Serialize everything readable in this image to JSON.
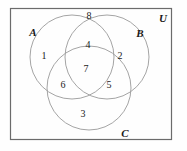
{
  "figure": {
    "type": "venn-diagram-3-set",
    "background_color": "#fefefe",
    "stroke_color": "#9a9a9a",
    "frame_color": "#6b6b6b",
    "text_color": "#1a1a1a"
  },
  "universe": {
    "label": "U",
    "frame": {
      "x": 10,
      "y": 8,
      "width": 162,
      "height": 132
    },
    "label_position": {
      "x": 163,
      "y": 18
    }
  },
  "sets": [
    {
      "id": "A",
      "label": "A",
      "circle": {
        "cx": 72,
        "cy": 57,
        "r": 42
      },
      "label_position": {
        "x": 33,
        "y": 32
      }
    },
    {
      "id": "B",
      "label": "B",
      "circle": {
        "cx": 107,
        "cy": 57,
        "r": 42
      },
      "label_position": {
        "x": 140,
        "y": 33
      }
    },
    {
      "id": "C",
      "label": "C",
      "circle": {
        "cx": 89,
        "cy": 88,
        "r": 42
      },
      "label_position": {
        "x": 125,
        "y": 133
      }
    }
  ],
  "regions": [
    {
      "id": "region-a-only",
      "label": "1",
      "membership": "A only",
      "position": {
        "x": 44,
        "y": 56
      }
    },
    {
      "id": "region-b-only",
      "label": "2",
      "membership": "B only",
      "position": {
        "x": 120,
        "y": 56
      }
    },
    {
      "id": "region-c-only",
      "label": "3",
      "membership": "C only",
      "position": {
        "x": 83,
        "y": 114
      }
    },
    {
      "id": "region-a-and-b",
      "label": "4",
      "membership": "A and B",
      "position": {
        "x": 88,
        "y": 45
      }
    },
    {
      "id": "region-b-and-c",
      "label": "5",
      "membership": "B and C",
      "position": {
        "x": 109,
        "y": 85
      }
    },
    {
      "id": "region-a-and-c",
      "label": "6",
      "membership": "A and C",
      "position": {
        "x": 63,
        "y": 85
      }
    },
    {
      "id": "region-a-b-and-c",
      "label": "7",
      "membership": "A and B and C",
      "position": {
        "x": 86,
        "y": 69
      }
    },
    {
      "id": "region-outside",
      "label": "8",
      "membership": "outside all sets",
      "position": {
        "x": 89,
        "y": 16
      }
    }
  ],
  "chart_data": {
    "type": "diagram",
    "title": "",
    "sets": [
      "A",
      "B",
      "C"
    ],
    "universe": "U",
    "region_labels": {
      "A_only": "1",
      "B_only": "2",
      "C_only": "3",
      "A_and_B": "4",
      "B_and_C": "5",
      "A_and_C": "6",
      "A_and_B_and_C": "7",
      "outside": "8"
    }
  }
}
